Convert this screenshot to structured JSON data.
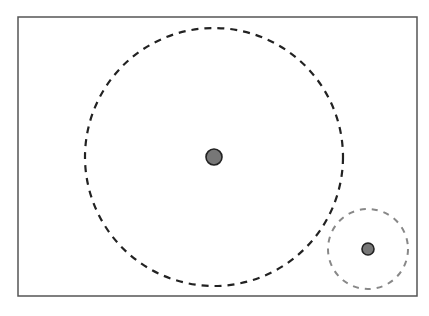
{
  "diagram": {
    "width": 429,
    "height": 316,
    "frame": {
      "x": 18,
      "y": 17,
      "width": 399,
      "height": 279,
      "stroke": "#555555"
    },
    "circles": [
      {
        "name": "large-range-circle",
        "cx": 214,
        "cy": 157,
        "r": 129,
        "stroke": "#222222",
        "dash": "7 6",
        "stroke_width": 2.2
      },
      {
        "name": "small-range-circle",
        "cx": 368,
        "cy": 249,
        "r": 40,
        "stroke": "#888888",
        "dash": "6 6",
        "stroke_width": 2
      }
    ],
    "points": [
      {
        "name": "large-center-point",
        "cx": 214,
        "cy": 157,
        "r": 8,
        "fill": "#777777",
        "stroke": "#222222"
      },
      {
        "name": "small-center-point",
        "cx": 368,
        "cy": 249,
        "r": 6,
        "fill": "#777777",
        "stroke": "#222222"
      }
    ]
  }
}
